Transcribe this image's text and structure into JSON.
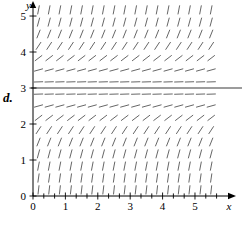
{
  "figure": {
    "part_label": "d.",
    "background_color": "#ffffff",
    "ink_color": "#000000",
    "field_color": "#555555"
  },
  "axes": {
    "x_name": "x",
    "y_name": "y",
    "x_tick_labels": [
      "0",
      "1",
      "2",
      "3",
      "4",
      "5"
    ],
    "y_tick_labels": [
      "0",
      "1",
      "2",
      "3",
      "4",
      "5"
    ],
    "origin_label": "0",
    "x_arrow": "arrow-right",
    "y_arrow": "arrow-up"
  },
  "chart_data": {
    "type": "scatter",
    "title": "",
    "xlabel": "x",
    "ylabel": "y",
    "xlim": [
      0,
      5.8
    ],
    "ylim": [
      0,
      5.4
    ],
    "grid": false,
    "legend": false,
    "plot_kind": "slope-field",
    "equilibrium_lines": [
      3
    ],
    "x_ticks": [
      0,
      1,
      2,
      3,
      4,
      5
    ],
    "y_ticks": [
      0,
      1,
      2,
      3,
      4,
      5
    ],
    "minor_tick_step": 0.3333,
    "sample_x": [
      0.17,
      0.5,
      0.83,
      1.17,
      1.5,
      1.83,
      2.17,
      2.5,
      2.83,
      3.17,
      3.5,
      3.83,
      4.17,
      4.5,
      4.83,
      5.17,
      5.5
    ],
    "sample_y": [
      0.17,
      0.5,
      0.83,
      1.17,
      1.5,
      1.83,
      2.17,
      2.5,
      2.83,
      3.17,
      3.5,
      3.83,
      4.17,
      4.5,
      4.83,
      5.17
    ],
    "slope_rule": "dy/dx = (y - 3)^2",
    "slope_by_y": [
      {
        "y": 0.17,
        "slope": 8.0
      },
      {
        "y": 0.5,
        "slope": 6.25
      },
      {
        "y": 0.83,
        "slope": 4.71
      },
      {
        "y": 1.17,
        "slope": 3.36
      },
      {
        "y": 1.5,
        "slope": 2.25
      },
      {
        "y": 1.83,
        "slope": 1.36
      },
      {
        "y": 2.17,
        "slope": 0.69
      },
      {
        "y": 2.5,
        "slope": 0.25
      },
      {
        "y": 2.83,
        "slope": 0.03
      },
      {
        "y": 3.0,
        "slope": 0.0
      },
      {
        "y": 3.17,
        "slope": 0.03
      },
      {
        "y": 3.5,
        "slope": 0.25
      },
      {
        "y": 3.83,
        "slope": 0.69
      },
      {
        "y": 4.17,
        "slope": 1.36
      },
      {
        "y": 4.5,
        "slope": 2.25
      },
      {
        "y": 4.83,
        "slope": 3.36
      },
      {
        "y": 5.17,
        "slope": 4.71
      }
    ]
  }
}
